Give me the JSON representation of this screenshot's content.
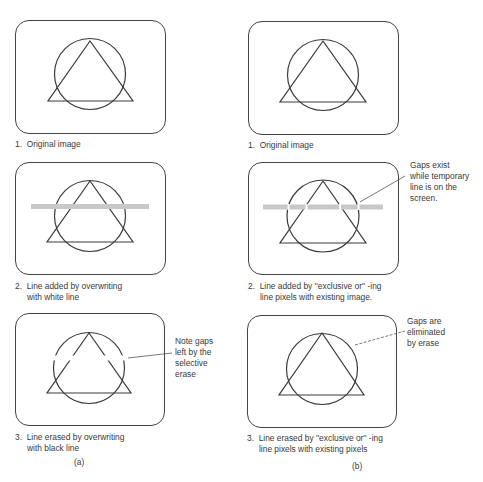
{
  "figure": {
    "left_column_label": "(a)",
    "right_column_label": "(b)"
  },
  "panels": {
    "a1": {
      "caption": "1.  Original image"
    },
    "a2": {
      "caption_line1": "2.  Line added by overwriting",
      "caption_line2": "with white line"
    },
    "a3": {
      "caption_line1": "3.  Line erased by overwriting",
      "caption_line2": "with black line",
      "note": "Note gaps\nleft by the\nselective\nerase"
    },
    "b1": {
      "caption": "1.  Original image"
    },
    "b2": {
      "caption_line1": "2.  Line added by ''exclusive or'' -ing",
      "caption_line2": "line pixels with existing image.",
      "note": "Gaps exist\nwhile temporary\nline is on the\nscreen."
    },
    "b3": {
      "caption_line1": "3.  Line erased by ''exclusive or'' -ing",
      "caption_line2": "line pixels with existing pixels",
      "note": "Gaps are\neliminated\nby erase"
    }
  },
  "colors": {
    "outline": "#444444",
    "shape_stroke": "#3a3a3a",
    "temp_line": "#c8c8c8"
  }
}
